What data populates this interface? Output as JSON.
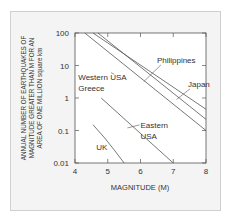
{
  "chart_data": {
    "type": "line",
    "title": "",
    "xlabel": "MAGNITUDE (M)",
    "ylabel_lines": [
      "ANNUAL NUMBER OF EARTHQUAKES OF",
      "MAGNITUDE GREATER THAN M FOR AN",
      "AREA OF ONE MILLION square km"
    ],
    "xlim": [
      4,
      8
    ],
    "ylim": [
      0.01,
      100
    ],
    "yscale": "log",
    "x_ticks": [
      4,
      5,
      6,
      7,
      8
    ],
    "x_tick_labels": [
      "4",
      "5",
      "6",
      "7",
      "8"
    ],
    "y_ticks": [
      100,
      10,
      1,
      0.1,
      0.01
    ],
    "y_tick_labels": [
      "100",
      "10",
      "1",
      "0.1",
      "0.01"
    ],
    "grid": false,
    "series": [
      {
        "name": "Philippines",
        "x": [
          4.55,
          8
        ],
        "y": [
          100,
          0.45
        ]
      },
      {
        "name": "Japan",
        "x": [
          4.7,
          8
        ],
        "y": [
          100,
          0.22
        ]
      },
      {
        "name": "Western USA, Greece",
        "x": [
          4.3,
          8
        ],
        "y": [
          100,
          0.1
        ]
      },
      {
        "name": "Eastern USA",
        "x": [
          4.8,
          7
        ],
        "y": [
          1,
          0.01
        ]
      },
      {
        "name": "UK",
        "x": [
          4.55,
          4.9,
          5.2,
          5.5
        ],
        "y": [
          0.15,
          0.06,
          0.025,
          0.01
        ]
      }
    ],
    "annotations": [
      {
        "text": "Philippines",
        "x": 6.5,
        "y": 12,
        "points_to": [
          6.1,
          3.2
        ]
      },
      {
        "text": "Japan",
        "x": 7.45,
        "y": 2.2,
        "points_to": [
          7.1,
          0.9
        ]
      },
      {
        "text": "Western USA",
        "x": 4.1,
        "y": 3.5,
        "points_to": [
          5.1,
          6
        ]
      },
      {
        "text": "Greece",
        "x": 4.1,
        "y": 1.6,
        "points_to": null
      },
      {
        "text": "Eastern",
        "x": 6.0,
        "y": 0.12,
        "points_to": [
          5.6,
          0.12
        ]
      },
      {
        "text": "USA",
        "x": 6.0,
        "y": 0.055,
        "points_to": null
      },
      {
        "text": "UK",
        "x": 4.65,
        "y": 0.025,
        "points_to": null
      }
    ]
  }
}
